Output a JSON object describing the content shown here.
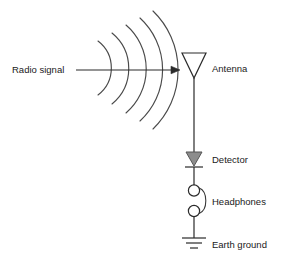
{
  "diagram": {
    "background_color": "#ffffff",
    "line_color": "#2b2b2b",
    "wave_color": "#4a4a4a",
    "detector_fill_color": "#8c8c8c",
    "text_color": "#1a1a1a"
  },
  "labels": {
    "radio_signal": "Radio signal",
    "antenna": "Antenna",
    "detector": "Detector",
    "headphones": "Headphones",
    "earth_ground": "Earth ground"
  },
  "components": [
    {
      "id": "radio-signal",
      "label": "Radio signal",
      "symbol": "arrow-right-with-wavefronts"
    },
    {
      "id": "antenna",
      "label": "Antenna",
      "symbol": "inverted-triangle-outline"
    },
    {
      "id": "detector",
      "label": "Detector",
      "symbol": "diode-filled-triangle-with-bar"
    },
    {
      "id": "headphones",
      "label": "Headphones",
      "symbol": "two-circles-with-curve"
    },
    {
      "id": "earth-ground",
      "label": "Earth ground",
      "symbol": "three-descending-bars"
    }
  ],
  "wavefronts": {
    "count": 5,
    "description": "five concentric arcs opening to the right"
  }
}
